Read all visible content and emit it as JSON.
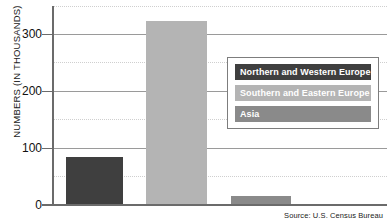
{
  "chart_data": {
    "type": "bar",
    "title": "",
    "subtitle": "",
    "xlabel": "",
    "ylabel": "NUMBERS (IN THOUSANDS)",
    "categories": [
      "Northern and Western Europe",
      "Southern and Eastern Europe",
      "Asia"
    ],
    "values": [
      86,
      333,
      16
    ],
    "ylim": [
      0,
      360
    ],
    "yticks": [
      0,
      100,
      200,
      300
    ],
    "ytick_labels": [
      "0",
      "100",
      "200",
      "300"
    ],
    "minor_gridlines": [
      50,
      150,
      250,
      350
    ],
    "grid": true,
    "legend_position": "inside-right",
    "series": [
      {
        "name": "Northern and Western Europe",
        "value": 86,
        "color": "#3f3f3f"
      },
      {
        "name": "Southern and Eastern Europe",
        "value": 333,
        "color": "#b4b4b4"
      },
      {
        "name": "Asia",
        "value": 16,
        "color": "#8a8a8a"
      }
    ],
    "annotations": {
      "source": "Source: U.S. Census Bureau"
    }
  },
  "axis": {
    "y_title": "NUMBERS (IN THOUSANDS)",
    "tick_0": "0",
    "tick_100": "100",
    "tick_200": "200",
    "tick_300": "300"
  },
  "legend": {
    "items": [
      {
        "label": "Northern and Western Europe",
        "color": "#3f3f3f"
      },
      {
        "label": "Southern and Eastern Europe",
        "color": "#b4b4b4"
      },
      {
        "label": "Asia",
        "color": "#8a8a8a"
      }
    ]
  },
  "footer": {
    "source": "Source: U.S. Census Bureau"
  },
  "colors": {
    "axis": "#6b6b6b",
    "major_grid": "#9a9a9a",
    "minor_grid": "#cfcfcf",
    "background": "#ffffff",
    "legend_border": "#7d7d7d",
    "text": "#111111"
  }
}
